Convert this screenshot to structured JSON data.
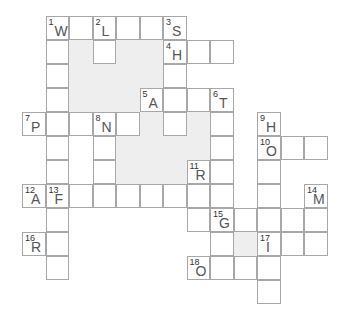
{
  "puzzle": {
    "type": "crossword",
    "cell_width": 23.5,
    "cell_height": 24,
    "origin_x": 22,
    "origin_y": 16,
    "colors": {
      "cell_bg": "#ffffff",
      "border": "#a8a8a8",
      "shade": "#eeeeee",
      "letter": "#555555"
    },
    "shaded_regions": [
      {
        "c": 2,
        "r": 1,
        "w": 4,
        "h": 3
      },
      {
        "c": 2,
        "r": 1,
        "w": 1,
        "h": 0
      },
      {
        "c": 4,
        "r": 4,
        "w": 1,
        "h": 0
      },
      {
        "c": 4,
        "r": 5,
        "w": 3,
        "h": 2
      },
      {
        "c": 5,
        "r": 4,
        "w": 1,
        "h": 1
      },
      {
        "c": 7,
        "r": 4,
        "w": 1,
        "h": 2
      },
      {
        "c": 9,
        "r": 8,
        "w": 1,
        "h": 2
      }
    ],
    "cells": [
      {
        "c": 1,
        "r": 0,
        "num": "1",
        "letter": "W"
      },
      {
        "c": 2,
        "r": 0
      },
      {
        "c": 3,
        "r": 0,
        "num": "2",
        "letter": "L"
      },
      {
        "c": 4,
        "r": 0
      },
      {
        "c": 5,
        "r": 0
      },
      {
        "c": 6,
        "r": 0,
        "num": "3",
        "letter": "S"
      },
      {
        "c": 1,
        "r": 1
      },
      {
        "c": 3,
        "r": 1
      },
      {
        "c": 6,
        "r": 1,
        "num": "4",
        "letter": "H"
      },
      {
        "c": 7,
        "r": 1
      },
      {
        "c": 8,
        "r": 1
      },
      {
        "c": 1,
        "r": 2
      },
      {
        "c": 6,
        "r": 2
      },
      {
        "c": 1,
        "r": 3
      },
      {
        "c": 5,
        "r": 3,
        "num": "5",
        "letter": "A"
      },
      {
        "c": 6,
        "r": 3
      },
      {
        "c": 7,
        "r": 3
      },
      {
        "c": 8,
        "r": 3,
        "num": "6",
        "letter": "T"
      },
      {
        "c": 0,
        "r": 4,
        "num": "7",
        "letter": "P"
      },
      {
        "c": 1,
        "r": 4
      },
      {
        "c": 2,
        "r": 4
      },
      {
        "c": 3,
        "r": 4,
        "num": "8",
        "letter": "N"
      },
      {
        "c": 4,
        "r": 4
      },
      {
        "c": 6,
        "r": 4
      },
      {
        "c": 8,
        "r": 4
      },
      {
        "c": 10,
        "r": 4,
        "num": "9",
        "letter": "H"
      },
      {
        "c": 1,
        "r": 5
      },
      {
        "c": 3,
        "r": 5
      },
      {
        "c": 8,
        "r": 5
      },
      {
        "c": 10,
        "r": 5,
        "num": "10",
        "letter": "O"
      },
      {
        "c": 11,
        "r": 5
      },
      {
        "c": 12,
        "r": 5
      },
      {
        "c": 1,
        "r": 6
      },
      {
        "c": 3,
        "r": 6
      },
      {
        "c": 7,
        "r": 6,
        "num": "11",
        "letter": "R"
      },
      {
        "c": 8,
        "r": 6
      },
      {
        "c": 10,
        "r": 6
      },
      {
        "c": 0,
        "r": 7,
        "num": "12",
        "letter": "A"
      },
      {
        "c": 1,
        "r": 7,
        "num": "13",
        "letter": "F"
      },
      {
        "c": 2,
        "r": 7
      },
      {
        "c": 3,
        "r": 7
      },
      {
        "c": 4,
        "r": 7
      },
      {
        "c": 5,
        "r": 7
      },
      {
        "c": 6,
        "r": 7
      },
      {
        "c": 7,
        "r": 7
      },
      {
        "c": 8,
        "r": 7
      },
      {
        "c": 10,
        "r": 7
      },
      {
        "c": 12,
        "r": 7,
        "num": "14",
        "letter": "M"
      },
      {
        "c": 1,
        "r": 8
      },
      {
        "c": 7,
        "r": 8
      },
      {
        "c": 8,
        "r": 8,
        "num": "15",
        "letter": "G"
      },
      {
        "c": 9,
        "r": 8
      },
      {
        "c": 10,
        "r": 8
      },
      {
        "c": 11,
        "r": 8
      },
      {
        "c": 12,
        "r": 8
      },
      {
        "c": 0,
        "r": 9,
        "num": "16",
        "letter": "R"
      },
      {
        "c": 1,
        "r": 9
      },
      {
        "c": 8,
        "r": 9
      },
      {
        "c": 10,
        "r": 9,
        "num": "17",
        "letter": "I"
      },
      {
        "c": 11,
        "r": 9
      },
      {
        "c": 12,
        "r": 9
      },
      {
        "c": 1,
        "r": 10
      },
      {
        "c": 7,
        "r": 10,
        "num": "18",
        "letter": "O"
      },
      {
        "c": 8,
        "r": 10
      },
      {
        "c": 9,
        "r": 10
      },
      {
        "c": 10,
        "r": 10
      },
      {
        "c": 10,
        "r": 11
      }
    ]
  }
}
